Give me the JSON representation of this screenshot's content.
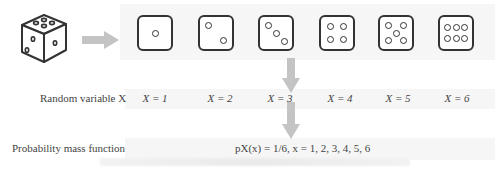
{
  "diagram": {
    "source_icon": "die-3d-icon",
    "faces": [
      {
        "value": 1,
        "pips": [
          [
            0.5,
            0.5
          ]
        ]
      },
      {
        "value": 2,
        "pips": [
          [
            0.28,
            0.28
          ],
          [
            0.72,
            0.72
          ]
        ]
      },
      {
        "value": 3,
        "pips": [
          [
            0.25,
            0.25
          ],
          [
            0.5,
            0.5
          ],
          [
            0.75,
            0.75
          ]
        ]
      },
      {
        "value": 4,
        "pips": [
          [
            0.3,
            0.3
          ],
          [
            0.7,
            0.3
          ],
          [
            0.3,
            0.7
          ],
          [
            0.7,
            0.7
          ]
        ]
      },
      {
        "value": 5,
        "pips": [
          [
            0.27,
            0.27
          ],
          [
            0.73,
            0.27
          ],
          [
            0.5,
            0.5
          ],
          [
            0.27,
            0.73
          ],
          [
            0.73,
            0.73
          ]
        ]
      },
      {
        "value": 6,
        "pips": [
          [
            0.22,
            0.32
          ],
          [
            0.5,
            0.32
          ],
          [
            0.78,
            0.32
          ],
          [
            0.22,
            0.68
          ],
          [
            0.5,
            0.68
          ],
          [
            0.78,
            0.68
          ]
        ]
      }
    ],
    "random_variable": {
      "label": "Random variable X",
      "values": [
        "X = 1",
        "X = 2",
        "X = 3",
        "X = 4",
        "X = 5",
        "X = 6"
      ]
    },
    "pmf": {
      "label": "Probability mass function",
      "formula": "pX(x) = 1/6, x = 1, 2, 3, 4, 5, 6"
    },
    "colors": {
      "arrow": "#c4c4c4",
      "band": "#f6f6f6",
      "outline": "#333333"
    }
  }
}
